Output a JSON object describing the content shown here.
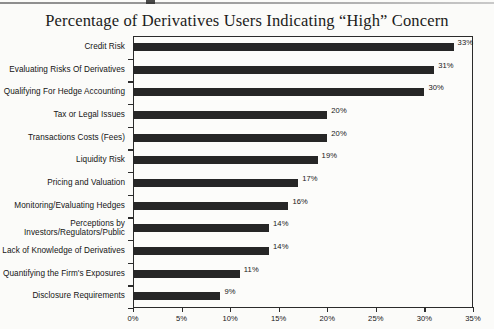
{
  "chart_data": {
    "type": "bar",
    "orientation": "horizontal",
    "title": "Percentage of Derivatives Users Indicating “High” Concern",
    "xlabel": "",
    "ylabel": "",
    "xlim": [
      0,
      35
    ],
    "grid": false,
    "legend": null,
    "xticks": [
      "0%",
      "5%",
      "10%",
      "15%",
      "20%",
      "25%",
      "30%",
      "35%"
    ],
    "xtick_values": [
      0,
      5,
      10,
      15,
      20,
      25,
      30,
      35
    ],
    "bar_color": "#262626",
    "categories": [
      "Credit Risk",
      "Evaluating Risks Of Derivatives",
      "Qualifying For Hedge Accounting",
      "Tax or Legal Issues",
      "Transactions Costs (Fees)",
      "Liquidity Risk",
      "Pricing and Valuation",
      "Monitoring/Evaluating Hedges",
      "Perceptions by\nInvestors/Regulators/Public",
      "Lack of Knowledge of Derivatives",
      "Quantifying the Firm's Exposures",
      "Disclosure Requirements"
    ],
    "values": [
      33,
      31,
      30,
      20,
      20,
      19,
      17,
      16,
      14,
      14,
      11,
      9
    ],
    "data_labels": [
      "33%",
      "31%",
      "30%",
      "20%",
      "20%",
      "19%",
      "17%",
      "16%",
      "14%",
      "14%",
      "11%",
      "9%"
    ]
  }
}
